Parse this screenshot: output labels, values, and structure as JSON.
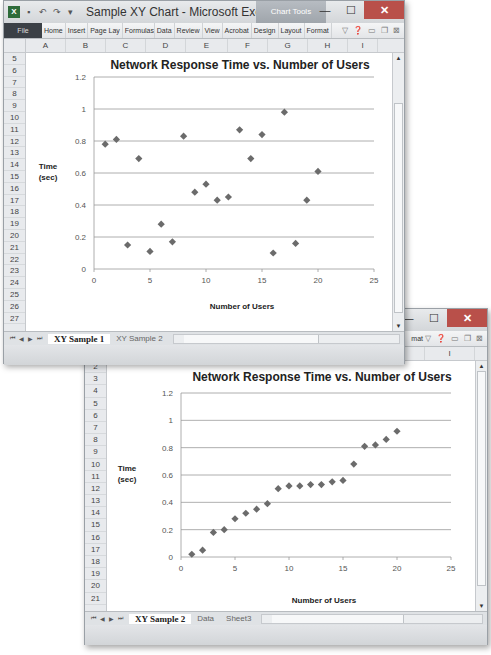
{
  "window1": {
    "title": "Sample XY Chart - Microsoft Excel",
    "context_tab": "Chart Tools",
    "qat_icons": [
      "excel-icon",
      "save-icon",
      "undo-icon",
      "redo-icon",
      "customize-icon"
    ],
    "ribbon_tabs": [
      "File",
      "Home",
      "Insert",
      "Page Lay",
      "Formulas",
      "Data",
      "Review",
      "View",
      "Acrobat",
      "Design",
      "Layout",
      "Format"
    ],
    "columns": [
      "A",
      "B",
      "C",
      "D",
      "E",
      "F",
      "G",
      "H",
      "I"
    ],
    "rows": [
      "5",
      "6",
      "7",
      "8",
      "9",
      "10",
      "11",
      "12",
      "13",
      "14",
      "15",
      "16",
      "17",
      "18",
      "19",
      "20",
      "21",
      "22",
      "23",
      "24",
      "25",
      "26",
      "27"
    ],
    "sheet_tabs": [
      "XY Sample 1",
      "XY Sample 2"
    ],
    "active_sheet": "XY Sample 1"
  },
  "window2": {
    "ribbon_partial": "mat",
    "columns": [
      "H",
      "I"
    ],
    "rows": [
      "2",
      "3",
      "4",
      "5",
      "6",
      "7",
      "8",
      "9",
      "10",
      "11",
      "12",
      "13",
      "14",
      "15",
      "16",
      "17",
      "18",
      "19",
      "20",
      "21"
    ],
    "sheet_tabs": [
      "XY Sample 2",
      "Data",
      "Sheet3"
    ],
    "active_sheet": "XY Sample 2"
  },
  "window_controls": {
    "minimize": "—",
    "maximize": "☐",
    "close": "✕"
  },
  "chart_data": [
    {
      "type": "scatter",
      "title": "Network Response Time vs. Number of Users",
      "xlabel": "Number of Users",
      "ylabel": "Time (sec)",
      "ylabel_lines": [
        "Time",
        "(sec)"
      ],
      "xlim": [
        0,
        25
      ],
      "ylim": [
        0,
        1.2
      ],
      "xticks": [
        0,
        5,
        10,
        15,
        20,
        25
      ],
      "yticks": [
        0,
        0.2,
        0.4,
        0.6,
        0.8,
        1,
        1.2
      ],
      "ytick_labels": [
        "0",
        "0.2",
        "0.4",
        "0.6",
        "0.8",
        "1",
        "1.2"
      ],
      "grid": "horizontal",
      "legend": "none",
      "marker": "diamond",
      "color": "#6b6b6b",
      "x": [
        1,
        2,
        3,
        4,
        5,
        6,
        7,
        8,
        9,
        10,
        11,
        12,
        13,
        14,
        15,
        16,
        17,
        18,
        19,
        20
      ],
      "y": [
        0.78,
        0.81,
        0.15,
        0.69,
        0.11,
        0.28,
        0.17,
        0.83,
        0.48,
        0.53,
        0.43,
        0.45,
        0.87,
        0.69,
        0.84,
        0.1,
        0.98,
        0.16,
        0.43,
        0.61
      ]
    },
    {
      "type": "scatter",
      "title": "Network Response Time vs. Number of Users",
      "xlabel": "Number of Users",
      "ylabel": "Time (sec)",
      "ylabel_lines": [
        "Time",
        "(sec)"
      ],
      "xlim": [
        0,
        25
      ],
      "ylim": [
        0,
        1.2
      ],
      "xticks": [
        0,
        5,
        10,
        15,
        20,
        25
      ],
      "yticks": [
        0,
        0.2,
        0.4,
        0.6,
        0.8,
        1,
        1.2
      ],
      "ytick_labels": [
        "0",
        "0.2",
        "0.4",
        "0.6",
        "0.8",
        "1",
        "1.2"
      ],
      "grid": "horizontal",
      "legend": "none",
      "marker": "diamond",
      "color": "#6b6b6b",
      "x": [
        1,
        2,
        3,
        4,
        5,
        6,
        7,
        8,
        9,
        10,
        11,
        12,
        13,
        14,
        15,
        16,
        17,
        18,
        19,
        20
      ],
      "y": [
        0.02,
        0.05,
        0.18,
        0.2,
        0.28,
        0.32,
        0.35,
        0.39,
        0.5,
        0.52,
        0.52,
        0.53,
        0.53,
        0.55,
        0.56,
        0.68,
        0.81,
        0.82,
        0.86,
        0.92
      ]
    }
  ]
}
